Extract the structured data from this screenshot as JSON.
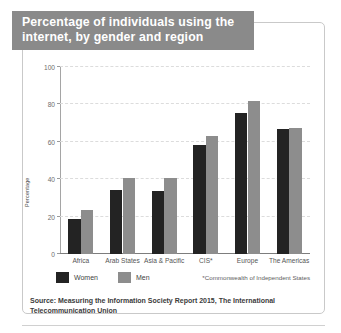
{
  "title": "Percentage of individuals using the internet, by gender and region",
  "source": "Source: Measuring the Information Society Report 2015, The International Telecommunication Union",
  "footnote": "*Commonwealth of Independent States",
  "legend": {
    "women_label": "Women",
    "men_label": "Men"
  },
  "colors": {
    "women": "#232323",
    "men": "#8d8d8d",
    "title_banner": "#8a8a8a",
    "title_text": "#ffffff",
    "gridline": "#dcdcdc",
    "frame": "#c9c9c9"
  },
  "chart_data": {
    "type": "bar",
    "title": "Percentage of individuals using the internet, by gender and region",
    "xlabel": "",
    "ylabel": "Percentage",
    "ylim": [
      0,
      100
    ],
    "yticks": [
      0,
      20,
      40,
      60,
      80,
      100
    ],
    "grid": true,
    "legend_position": "bottom-left",
    "categories": [
      "Africa",
      "Arab States",
      "Asia & Pacific",
      "CIS*",
      "Europe",
      "The Americas"
    ],
    "series": [
      {
        "name": "Women",
        "values": [
          18.5,
          34,
          33.5,
          58.5,
          75.5,
          67
        ]
      },
      {
        "name": "Men",
        "values": [
          23.5,
          40.5,
          40.5,
          63,
          82,
          67.5
        ]
      }
    ]
  }
}
